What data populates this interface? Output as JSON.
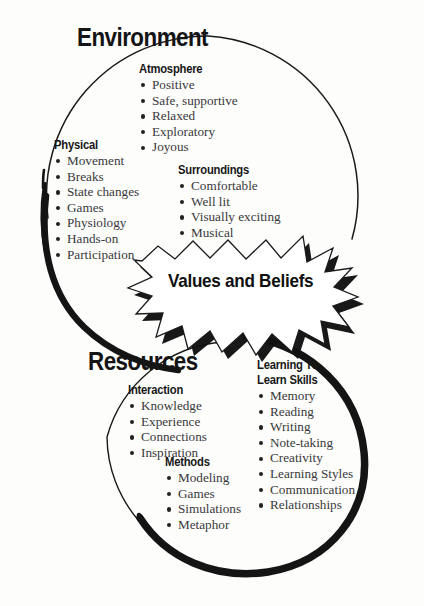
{
  "diagram": {
    "title_top": "Environment",
    "title_bottom": "Resources",
    "center_label": "Values and Beliefs",
    "shape_top": "circle-outline",
    "shape_bottom": "circle-outline",
    "shape_center": "starburst",
    "colors": {
      "ink": "#141414",
      "body_text": "#38383a",
      "background": "#fdfdfc",
      "stroke": "#1a1a1a"
    },
    "groups": [
      {
        "id": "atmosphere",
        "heading": "Atmosphere",
        "items": [
          "Positive",
          "Safe, supportive",
          "Relaxed",
          "Exploratory",
          "Joyous"
        ]
      },
      {
        "id": "physical",
        "heading": "Physical",
        "items": [
          "Movement",
          "Breaks",
          "State changes",
          "Games",
          "Physiology",
          "Hands-on",
          "Participation"
        ]
      },
      {
        "id": "surroundings",
        "heading": "Surroundings",
        "items": [
          "Comfortable",
          "Well lit",
          "Visually exciting",
          "Musical"
        ]
      },
      {
        "id": "interaction",
        "heading": "Interaction",
        "items": [
          "Knowledge",
          "Experience",
          "Connections",
          "Inspiration"
        ]
      },
      {
        "id": "methods",
        "heading": "Methods",
        "items": [
          "Modeling",
          "Games",
          "Simulations",
          "Metaphor"
        ]
      },
      {
        "id": "learn-skills",
        "heading": "Learning To\nLearn Skills",
        "heading_line1": "Learning To",
        "heading_line2": "Learn Skills",
        "items": [
          "Memory",
          "Reading",
          "Writing",
          "Note-taking",
          "Creativity",
          "Learning Styles",
          "Communication",
          "Relationships"
        ]
      }
    ]
  }
}
